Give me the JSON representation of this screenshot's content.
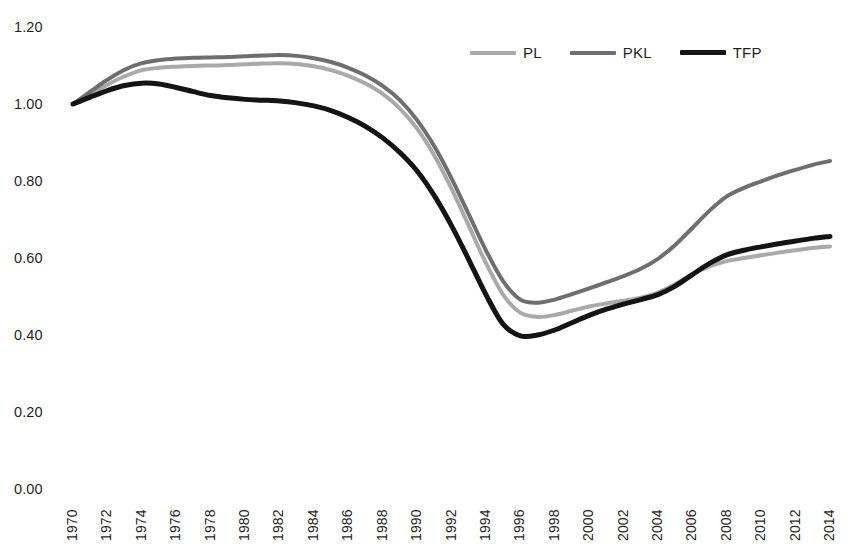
{
  "chart_data": {
    "type": "line",
    "title": "",
    "subtitle": "",
    "xlabel": "",
    "ylabel": "",
    "grid": false,
    "legend_position": "top-right",
    "ylim": [
      0.0,
      1.2
    ],
    "y_ticks": [
      "0.00",
      "0.20",
      "0.40",
      "0.60",
      "0.80",
      "1.00",
      "1.20"
    ],
    "y_tick_values": [
      0.0,
      0.2,
      0.4,
      0.6,
      0.8,
      1.0,
      1.2
    ],
    "x_tick_labels": [
      "1970",
      "1972",
      "1974",
      "1976",
      "1978",
      "1980",
      "1982",
      "1984",
      "1986",
      "1988",
      "1990",
      "1992",
      "1994",
      "1996",
      "1998",
      "2000",
      "2002",
      "2004",
      "2006",
      "2008",
      "2010",
      "2012",
      "2014"
    ],
    "xlim": [
      1970,
      2014
    ],
    "x": [
      1970,
      1971,
      1972,
      1973,
      1974,
      1975,
      1976,
      1977,
      1978,
      1979,
      1980,
      1981,
      1982,
      1983,
      1984,
      1985,
      1986,
      1987,
      1988,
      1989,
      1990,
      1991,
      1992,
      1993,
      1994,
      1995,
      1996,
      1997,
      1998,
      1999,
      2000,
      2001,
      2002,
      2003,
      2004,
      2005,
      2006,
      2007,
      2008,
      2009,
      2010,
      2011,
      2012,
      2013,
      2014
    ],
    "series": [
      {
        "name": "PL",
        "color": "#a9a9a9",
        "width": 4,
        "values": [
          1.0,
          1.025,
          1.05,
          1.072,
          1.088,
          1.094,
          1.097,
          1.099,
          1.1,
          1.101,
          1.103,
          1.105,
          1.106,
          1.104,
          1.098,
          1.088,
          1.073,
          1.053,
          1.026,
          0.988,
          0.936,
          0.866,
          0.78,
          0.684,
          0.587,
          0.505,
          0.458,
          0.447,
          0.452,
          0.463,
          0.474,
          0.482,
          0.489,
          0.497,
          0.51,
          0.532,
          0.558,
          0.578,
          0.592,
          0.6,
          0.607,
          0.614,
          0.62,
          0.626,
          0.63
        ]
      },
      {
        "name": "PKL",
        "color": "#6e6e6e",
        "width": 4,
        "values": [
          1.0,
          1.032,
          1.063,
          1.089,
          1.106,
          1.114,
          1.118,
          1.12,
          1.121,
          1.122,
          1.124,
          1.126,
          1.127,
          1.125,
          1.119,
          1.109,
          1.094,
          1.074,
          1.047,
          1.01,
          0.958,
          0.89,
          0.807,
          0.714,
          0.62,
          0.54,
          0.492,
          0.484,
          0.492,
          0.506,
          0.521,
          0.537,
          0.553,
          0.572,
          0.598,
          0.634,
          0.678,
          0.723,
          0.76,
          0.782,
          0.799,
          0.815,
          0.829,
          0.842,
          0.852
        ]
      },
      {
        "name": "TFP",
        "color": "#141414",
        "width": 5,
        "values": [
          1.0,
          1.018,
          1.035,
          1.048,
          1.054,
          1.052,
          1.043,
          1.032,
          1.022,
          1.016,
          1.012,
          1.01,
          1.008,
          1.003,
          0.995,
          0.983,
          0.965,
          0.942,
          0.912,
          0.874,
          0.826,
          0.762,
          0.684,
          0.596,
          0.505,
          0.428,
          0.398,
          0.4,
          0.413,
          0.432,
          0.451,
          0.467,
          0.48,
          0.492,
          0.505,
          0.527,
          0.557,
          0.586,
          0.608,
          0.62,
          0.629,
          0.637,
          0.644,
          0.651,
          0.656
        ]
      }
    ]
  },
  "legend": {
    "entries": [
      {
        "label": "PL",
        "color": "#a9a9a9"
      },
      {
        "label": "PKL",
        "color": "#6e6e6e"
      },
      {
        "label": "TFP",
        "color": "#141414"
      }
    ]
  }
}
